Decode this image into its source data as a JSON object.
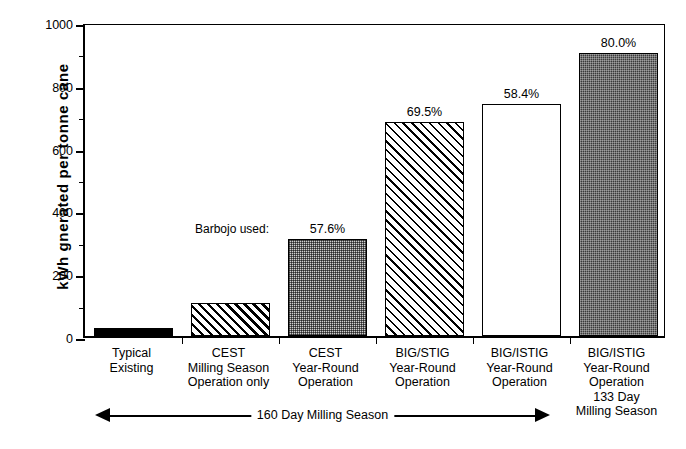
{
  "chart_data": {
    "type": "bar",
    "title": "",
    "xlabel": "",
    "ylabel": "kWh gnerated per tonne cane",
    "ylim": [
      0,
      1000
    ],
    "ytick_values": [
      0,
      200,
      400,
      600,
      800,
      1000
    ],
    "ytick_labels": [
      "0",
      "200",
      "400",
      "600",
      "800",
      "1000"
    ],
    "yminor_ticks": [
      100,
      300,
      500,
      700,
      900
    ],
    "grid": false,
    "legend": "none",
    "categories": [
      "Typical Existing",
      "CEST Milling Season Operation only",
      "CEST Year-Round Operation",
      "BIG/STIG Year-Round Operation",
      "BIG/ISTIG Year-Round Operation",
      "BIG/ISTIG Year-Round Operation 133 Day Milling Season"
    ],
    "values": [
      25,
      105,
      309,
      680,
      740,
      900
    ],
    "bar_labels": [
      "",
      "",
      "57.6%",
      "69.5%",
      "58.4%",
      "80.0%"
    ],
    "annotations": [
      {
        "text": "Barbojo used:",
        "near_bar": 2
      },
      {
        "text": "160 Day Milling Season",
        "position": "below-axis"
      }
    ]
  },
  "yaxis": {
    "title": "kWh gnerated per tonne cane",
    "ticks": [
      {
        "value": 1000,
        "label": "1000"
      },
      {
        "value": 900,
        "label": ""
      },
      {
        "value": 800,
        "label": "800"
      },
      {
        "value": 700,
        "label": ""
      },
      {
        "value": 600,
        "label": "600"
      },
      {
        "value": 500,
        "label": ""
      },
      {
        "value": 400,
        "label": "400"
      },
      {
        "value": 300,
        "label": ""
      },
      {
        "value": 200,
        "label": "200"
      },
      {
        "value": 100,
        "label": ""
      },
      {
        "value": 0,
        "label": "0"
      }
    ]
  },
  "bars": [
    {
      "id": "typical-existing",
      "value": 25,
      "label": "",
      "fill": "solid",
      "lines": [
        "Typical",
        "Existing"
      ]
    },
    {
      "id": "cest-milling-season",
      "value": 105,
      "label": "",
      "fill": "hatch",
      "lines": [
        "CEST",
        "Milling Season",
        "Operation only"
      ]
    },
    {
      "id": "cest-year-round",
      "value": 309,
      "label": "57.6%",
      "fill": "stipple",
      "lines": [
        "CEST",
        "Year-Round",
        "Operation"
      ]
    },
    {
      "id": "big-stig-year-round",
      "value": 680,
      "label": "69.5%",
      "fill": "hatchfine",
      "lines": [
        "BIG/STIG",
        "Year-Round",
        "Operation"
      ]
    },
    {
      "id": "big-istig-year-round",
      "value": 740,
      "label": "58.4%",
      "fill": "empty",
      "lines": [
        "BIG/ISTIG",
        "Year-Round",
        "Operation"
      ]
    },
    {
      "id": "big-istig-133-day",
      "value": 900,
      "label": "80.0%",
      "fill": "dark",
      "lines": [
        "BIG/ISTIG",
        "Year-Round",
        "Operation",
        "133 Day",
        "Milling Season"
      ]
    }
  ],
  "annotation": {
    "barbojo": "Barbojo used:",
    "season_arrow": "160 Day Milling Season"
  },
  "colors": {
    "axis": "#000000",
    "bar_solid": "#000000",
    "bar_dark": "#3a3a3a",
    "bar_stipple": "#cfcfcf",
    "background": "#ffffff"
  }
}
